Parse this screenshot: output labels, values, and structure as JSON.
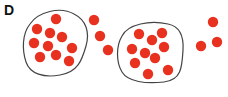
{
  "panel": {
    "label": "D",
    "dot_color": "#e8321f",
    "outline_color": "#444444"
  },
  "clusters": [
    {
      "name": "cluster-1",
      "enclosed_dots": [
        [
          56,
          19
        ],
        [
          37,
          29
        ],
        [
          50,
          33
        ],
        [
          62,
          37
        ],
        [
          34,
          43
        ],
        [
          48,
          46
        ],
        [
          72,
          48
        ],
        [
          40,
          57
        ],
        [
          56,
          55
        ],
        [
          69,
          61
        ]
      ],
      "outside_dots": [
        [
          94,
          20
        ],
        [
          100,
          36
        ],
        [
          108,
          50
        ]
      ]
    },
    {
      "name": "cluster-2",
      "enclosed_dots": [
        [
          139,
          34
        ],
        [
          162,
          33
        ],
        [
          152,
          40
        ],
        [
          132,
          49
        ],
        [
          145,
          53
        ],
        [
          164,
          47
        ],
        [
          135,
          63
        ],
        [
          155,
          58
        ],
        [
          168,
          70
        ],
        [
          148,
          74
        ]
      ],
      "outside_dots": [
        [
          213,
          22
        ],
        [
          201,
          46
        ],
        [
          217,
          42
        ]
      ]
    }
  ]
}
